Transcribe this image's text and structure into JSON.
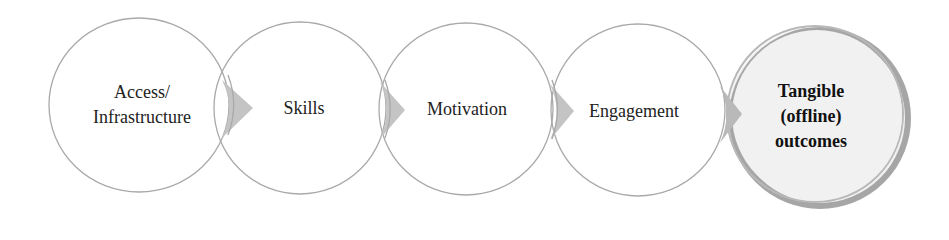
{
  "diagram": {
    "type": "process-flow",
    "direction": "left-to-right",
    "colors": {
      "circle_stroke": "#a9a9a9",
      "circle_fill": "#ffffff",
      "final_fill": "#f1f1f1",
      "final_ring": "#a6a6a6",
      "arrow_fill": "#c4c4c4",
      "text": "#222222"
    },
    "stages": [
      {
        "id": "access",
        "lines": [
          "Access/",
          "Infrastructure"
        ],
        "bold": false
      },
      {
        "id": "skills",
        "lines": [
          "Skills"
        ],
        "bold": false
      },
      {
        "id": "motivation",
        "lines": [
          "Motivation"
        ],
        "bold": false
      },
      {
        "id": "engagement",
        "lines": [
          "Engagement"
        ],
        "bold": false
      },
      {
        "id": "outcomes",
        "lines": [
          "Tangible",
          "(offline)",
          "outcomes"
        ],
        "bold": true,
        "highlighted": true
      }
    ],
    "connectors": [
      {
        "from": "access",
        "to": "skills",
        "shape": "chevron-arrow"
      },
      {
        "from": "skills",
        "to": "motivation",
        "shape": "chevron-arrow"
      },
      {
        "from": "motivation",
        "to": "engagement",
        "shape": "chevron-arrow"
      },
      {
        "from": "engagement",
        "to": "outcomes",
        "shape": "chevron-arrow"
      }
    ]
  }
}
